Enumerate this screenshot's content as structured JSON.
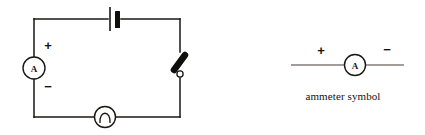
{
  "figure": {
    "background_color": "#ffffff",
    "ink_color": "#15120f",
    "width": 425,
    "height": 135
  },
  "circuit": {
    "name": "simple series circuit",
    "loop": {
      "left": 34,
      "top": 19,
      "right": 180,
      "bottom": 117
    },
    "components": [
      {
        "id": "battery",
        "type": "battery-cell",
        "label": "",
        "position": {
          "x": 114,
          "y": 19
        }
      },
      {
        "id": "ammeter",
        "type": "ammeter",
        "meter_letter": "A",
        "plus_sign": "+",
        "minus_sign": "−",
        "position": {
          "x": 34,
          "y": 68
        }
      },
      {
        "id": "switch",
        "type": "open-switch",
        "label": "",
        "position": {
          "x": 180,
          "y": 68
        }
      },
      {
        "id": "lamp",
        "type": "lamp-bulb",
        "label": "",
        "position": {
          "x": 105,
          "y": 117
        }
      }
    ]
  },
  "legend": {
    "caption": "ammeter symbol",
    "meter_letter": "A",
    "plus_sign": "+",
    "minus_sign": "−",
    "line": {
      "x1": 291,
      "x2": 404,
      "y": 65
    },
    "circle": {
      "cx": 355,
      "cy": 65,
      "r": 10
    }
  }
}
